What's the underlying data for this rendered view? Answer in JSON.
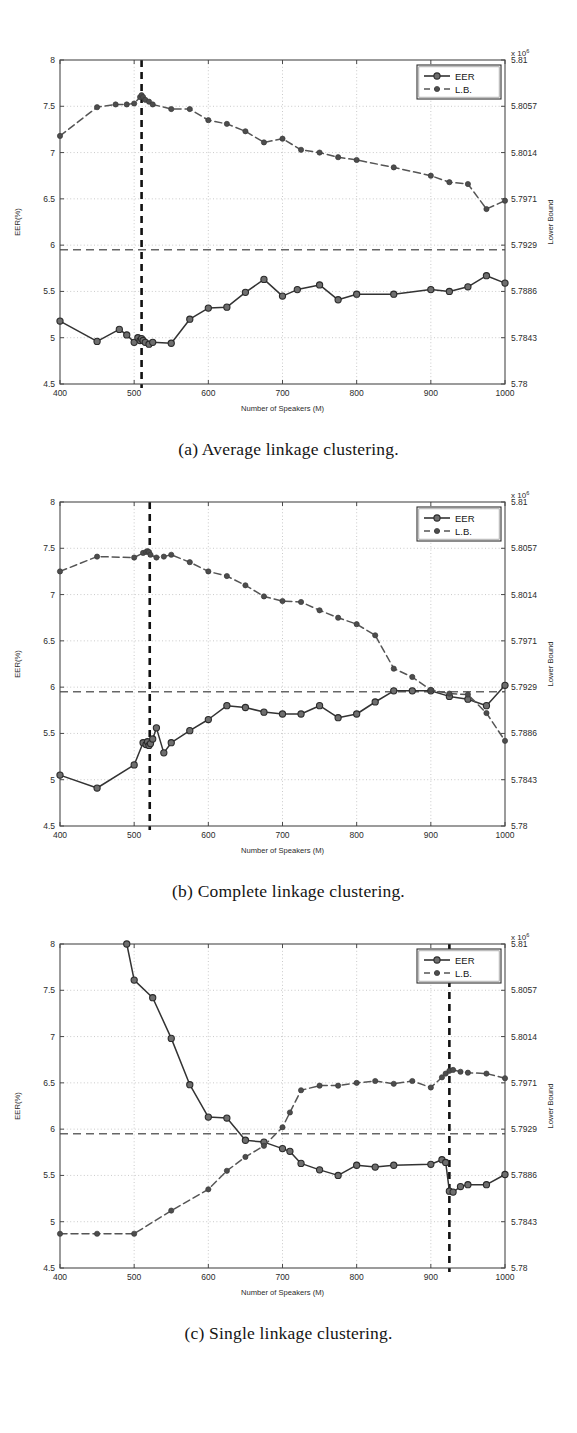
{
  "page": {
    "faint_header_text": "",
    "background": "#ffffff"
  },
  "figures": [
    {
      "id": "fig-a",
      "caption": "(a) Average linkage clustering.",
      "legend": {
        "eer": "EER",
        "lb": "L.B."
      },
      "axis": {
        "xlabel": "Number of Speakers (M)",
        "ylabel_left": "EER(%)",
        "ylabel_right": "Lower Bound",
        "exponent_prefix": "x 10",
        "exponent_power": "6",
        "xticks": [
          400,
          500,
          600,
          700,
          800,
          900,
          1000
        ],
        "yticks_left": [
          "8",
          "7.5",
          "7",
          "6.5",
          "6",
          "5.5",
          "5",
          "4.5"
        ],
        "yticks_right": [
          "5.81",
          "5.8057",
          "5.8014",
          "5.7971",
          "5.7929",
          "5.7886",
          "5.7843",
          "5.78"
        ],
        "xlim": [
          400,
          1000
        ],
        "ylim_left": [
          4.5,
          8
        ],
        "ylim_right": [
          5.78,
          5.81
        ]
      },
      "marker_line_x": 510,
      "hline_y": 5.95,
      "colors": {
        "eer": "#333333",
        "lb": "#555555",
        "marker_line": "#111111",
        "grid": "#bdbdbd"
      }
    },
    {
      "id": "fig-b",
      "caption": "(b) Complete linkage clustering.",
      "legend": {
        "eer": "EER",
        "lb": "L.B."
      },
      "axis": {
        "xlabel": "Number of Speakers (M)",
        "ylabel_left": "EER(%)",
        "ylabel_right": "Lower Bound",
        "exponent_prefix": "x 10",
        "exponent_power": "6",
        "xticks": [
          400,
          500,
          600,
          700,
          800,
          900,
          1000
        ],
        "yticks_left": [
          "8",
          "7.5",
          "7",
          "6.5",
          "6",
          "5.5",
          "5",
          "4.5"
        ],
        "yticks_right": [
          "5.81",
          "5.8057",
          "5.8014",
          "5.7971",
          "5.7929",
          "5.7886",
          "5.7843",
          "5.78"
        ],
        "xlim": [
          400,
          1000
        ],
        "ylim_left": [
          4.5,
          8
        ],
        "ylim_right": [
          5.78,
          5.81
        ]
      },
      "marker_line_x": 521,
      "hline_y": 5.95,
      "colors": {
        "eer": "#333333",
        "lb": "#555555",
        "marker_line": "#111111",
        "grid": "#bdbdbd"
      }
    },
    {
      "id": "fig-c",
      "caption": "(c) Single linkage clustering.",
      "legend": {
        "eer": "EER",
        "lb": "L.B."
      },
      "axis": {
        "xlabel": "Number of Speakers (M)",
        "ylabel_left": "EER(%)",
        "ylabel_right": "Lower Bound",
        "exponent_prefix": "x 10",
        "exponent_power": "6",
        "xticks": [
          400,
          500,
          600,
          700,
          800,
          900,
          1000
        ],
        "yticks_left": [
          "8",
          "7.5",
          "7",
          "6.5",
          "6",
          "5.5",
          "5",
          "4.5"
        ],
        "yticks_right": [
          "5.81",
          "5.8057",
          "5.8014",
          "5.7971",
          "5.7929",
          "5.7886",
          "5.7843",
          "5.78"
        ],
        "xlim": [
          400,
          1000
        ],
        "ylim_left": [
          4.5,
          8
        ],
        "ylim_right": [
          5.78,
          5.81
        ]
      },
      "marker_line_x": 925,
      "hline_y": 5.95,
      "colors": {
        "eer": "#333333",
        "lb": "#555555",
        "marker_line": "#111111",
        "grid": "#bdbdbd"
      }
    }
  ],
  "chart_data": [
    {
      "type": "line",
      "id": "fig-a",
      "title": "(a) Average linkage clustering.",
      "xlabel": "Number of Speakers (M)",
      "ylabel": "EER(%)",
      "ylabel_secondary": "Lower Bound",
      "xlim": [
        400,
        1000
      ],
      "ylim": [
        4.5,
        8
      ],
      "ylim_secondary": [
        5.78,
        5.81
      ],
      "grid": true,
      "legend": [
        "EER",
        "L.B."
      ],
      "legend_position": "top-right",
      "annotations": [
        {
          "kind": "vline",
          "x": 510,
          "style": "dashed-bold"
        },
        {
          "kind": "hline",
          "y": 5.95,
          "style": "dashed",
          "axis": "left"
        }
      ],
      "series": [
        {
          "name": "EER",
          "axis": "left",
          "style": "solid",
          "x": [
            400,
            450,
            480,
            490,
            500,
            505,
            508,
            510,
            512,
            515,
            520,
            525,
            550,
            575,
            600,
            625,
            650,
            675,
            700,
            720,
            750,
            775,
            800,
            850,
            900,
            925,
            950,
            975,
            1000
          ],
          "y": [
            5.18,
            4.96,
            5.09,
            5.03,
            4.95,
            5.0,
            4.97,
            4.99,
            4.97,
            4.95,
            4.93,
            4.95,
            4.94,
            5.2,
            5.32,
            5.33,
            5.49,
            5.63,
            5.45,
            5.52,
            5.57,
            5.41,
            5.47,
            5.47,
            5.52,
            5.5,
            5.55,
            5.67,
            5.59
          ]
        },
        {
          "name": "L.B.",
          "axis": "right",
          "style": "dashed",
          "x": [
            400,
            450,
            475,
            490,
            500,
            508,
            510,
            512,
            515,
            520,
            525,
            550,
            575,
            600,
            625,
            650,
            675,
            700,
            725,
            750,
            775,
            800,
            850,
            900,
            925,
            950,
            975,
            1000
          ],
          "y": [
            7.18,
            7.49,
            7.52,
            7.52,
            7.53,
            7.6,
            7.62,
            7.6,
            7.57,
            7.55,
            7.52,
            7.47,
            7.47,
            7.35,
            7.31,
            7.23,
            7.11,
            7.15,
            7.03,
            7.0,
            6.95,
            6.92,
            6.84,
            6.75,
            6.68,
            6.66,
            6.39,
            6.48
          ]
        }
      ]
    },
    {
      "type": "line",
      "id": "fig-b",
      "title": "(b) Complete linkage clustering.",
      "xlabel": "Number of Speakers (M)",
      "ylabel": "EER(%)",
      "ylabel_secondary": "Lower Bound",
      "xlim": [
        400,
        1000
      ],
      "ylim": [
        4.5,
        8
      ],
      "ylim_secondary": [
        5.78,
        5.81
      ],
      "grid": true,
      "legend": [
        "EER",
        "L.B."
      ],
      "legend_position": "top-right",
      "annotations": [
        {
          "kind": "vline",
          "x": 521,
          "style": "dashed-bold"
        },
        {
          "kind": "hline",
          "y": 5.95,
          "style": "dashed",
          "axis": "left"
        }
      ],
      "series": [
        {
          "name": "EER",
          "axis": "left",
          "style": "solid",
          "x": [
            400,
            450,
            500,
            512,
            516,
            518,
            520,
            522,
            525,
            530,
            540,
            550,
            575,
            600,
            625,
            650,
            675,
            700,
            725,
            750,
            775,
            800,
            825,
            850,
            875,
            900,
            925,
            950,
            975,
            1000
          ],
          "y": [
            5.05,
            4.91,
            5.16,
            5.4,
            5.38,
            5.41,
            5.37,
            5.39,
            5.44,
            5.56,
            5.29,
            5.4,
            5.53,
            5.65,
            5.8,
            5.78,
            5.73,
            5.71,
            5.71,
            5.8,
            5.67,
            5.71,
            5.84,
            5.96,
            5.96,
            5.96,
            5.9,
            5.87,
            5.8,
            6.02
          ]
        },
        {
          "name": "L.B.",
          "axis": "right",
          "style": "dashed",
          "x": [
            400,
            450,
            500,
            512,
            516,
            518,
            520,
            522,
            530,
            540,
            550,
            575,
            600,
            625,
            650,
            675,
            700,
            725,
            750,
            775,
            800,
            825,
            850,
            875,
            900,
            925,
            950,
            975,
            1000
          ],
          "y": [
            7.25,
            7.41,
            7.4,
            7.45,
            7.46,
            7.47,
            7.46,
            7.43,
            7.4,
            7.41,
            7.43,
            7.35,
            7.25,
            7.2,
            7.1,
            6.98,
            6.93,
            6.92,
            6.83,
            6.75,
            6.68,
            6.56,
            6.2,
            6.11,
            5.97,
            5.93,
            5.92,
            5.72,
            5.42
          ]
        }
      ]
    },
    {
      "type": "line",
      "id": "fig-c",
      "title": "(c) Single linkage clustering.",
      "xlabel": "Number of Speakers (M)",
      "ylabel": "EER(%)",
      "ylabel_secondary": "Lower Bound",
      "xlim": [
        400,
        1000
      ],
      "ylim": [
        4.5,
        8
      ],
      "ylim_secondary": [
        5.78,
        5.81
      ],
      "grid": true,
      "legend": [
        "EER",
        "L.B."
      ],
      "legend_position": "top-right",
      "annotations": [
        {
          "kind": "vline",
          "x": 925,
          "style": "dashed-bold"
        },
        {
          "kind": "hline",
          "y": 5.95,
          "style": "dashed",
          "axis": "left"
        }
      ],
      "series": [
        {
          "name": "EER",
          "axis": "left",
          "style": "solid",
          "x": [
            490,
            500,
            525,
            550,
            575,
            600,
            625,
            650,
            675,
            700,
            710,
            725,
            750,
            775,
            800,
            825,
            850,
            900,
            915,
            920,
            925,
            930,
            940,
            950,
            975,
            1000
          ],
          "y": [
            8.0,
            7.61,
            7.42,
            6.98,
            6.48,
            6.13,
            6.12,
            5.88,
            5.86,
            5.79,
            5.76,
            5.63,
            5.56,
            5.5,
            5.61,
            5.59,
            5.61,
            5.62,
            5.67,
            5.64,
            5.33,
            5.32,
            5.38,
            5.4,
            5.4,
            5.51
          ]
        },
        {
          "name": "L.B.",
          "axis": "right",
          "style": "dashed",
          "x": [
            400,
            450,
            500,
            550,
            600,
            625,
            650,
            675,
            700,
            710,
            725,
            750,
            775,
            800,
            825,
            850,
            875,
            900,
            915,
            920,
            925,
            930,
            940,
            950,
            975,
            1000
          ],
          "y": [
            4.87,
            4.87,
            4.87,
            5.12,
            5.35,
            5.55,
            5.7,
            5.82,
            6.02,
            6.18,
            6.42,
            6.47,
            6.47,
            6.5,
            6.52,
            6.49,
            6.52,
            6.45,
            6.56,
            6.6,
            6.63,
            6.64,
            6.62,
            6.61,
            6.6,
            6.55
          ]
        }
      ]
    }
  ]
}
